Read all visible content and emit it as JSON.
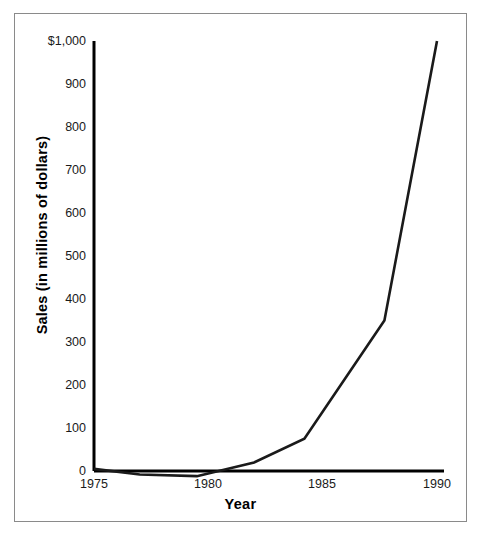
{
  "chart_data": {
    "type": "line",
    "title": "",
    "xlabel": "Year",
    "ylabel": "Sales (in millions of dollars)",
    "xlim": [
      1975,
      1990.6
    ],
    "ylim": [
      -25,
      1020
    ],
    "grid": false,
    "legend": null,
    "xticks": [
      1975,
      1980,
      1985,
      1990
    ],
    "xtick_labels": [
      "1975",
      "1980",
      "1985",
      "1990"
    ],
    "yticks": [
      0,
      100,
      200,
      300,
      400,
      500,
      600,
      700,
      800,
      900,
      1000
    ],
    "ytick_labels": [
      "0",
      "100",
      "200",
      "300",
      "400",
      "500",
      "600",
      "700",
      "800",
      "900",
      "$1,000"
    ],
    "series": [
      {
        "name": "Sales",
        "color": "#1a1a1a",
        "x": [
          1975,
          1977,
          1979.5,
          1982,
          1984.2,
          1987.7,
          1990
        ],
        "values": [
          5,
          -8,
          -12,
          20,
          75,
          350,
          1000
        ]
      }
    ]
  },
  "axis_geometry": {
    "left_px": 94,
    "right_px": 444,
    "top_px": 41,
    "bottom_px": 471,
    "x_1975_px": 94,
    "x_1990_px": 437,
    "y_0_px": 471,
    "y_1000_px": 41
  },
  "style": {
    "line_color": "#1a1a1a",
    "axis_color": "#000000",
    "frame_color": "#8a8a8a",
    "background": "#ffffff",
    "tick_text_color": "#1a1a1a"
  }
}
